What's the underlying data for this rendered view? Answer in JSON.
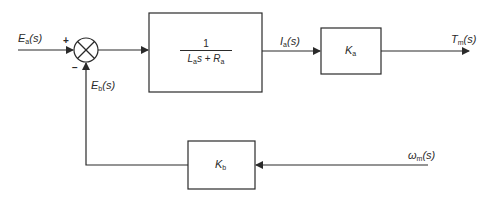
{
  "diagram": {
    "type": "block-diagram",
    "title": "",
    "input": {
      "symbol": "E",
      "subscript": "a",
      "arg": "(s)"
    },
    "summing_junction": {
      "plus_sign": "+",
      "minus_sign": "−"
    },
    "feedback_signal": {
      "symbol": "E",
      "subscript": "b",
      "arg": "(s)"
    },
    "forward_block": {
      "numerator": "1",
      "denominator": {
        "term1_symbol": "L",
        "term1_sub": "a",
        "term1_var": "s",
        "operator": "+",
        "term2_symbol": "R",
        "term2_sub": "a"
      }
    },
    "intermediate_signal": {
      "symbol": "I",
      "subscript": "a",
      "arg": "(s)"
    },
    "gain_block_forward": {
      "symbol": "K",
      "subscript": "a"
    },
    "output": {
      "symbol": "T",
      "subscript": "m",
      "arg": "(s)"
    },
    "gain_block_feedback": {
      "symbol": "K",
      "subscript": "b"
    },
    "feedback_input": {
      "symbol": "ω",
      "subscript": "m",
      "arg": "(s)"
    },
    "colors": {
      "stroke": "#2a2a2a",
      "background": "#ffffff"
    }
  }
}
